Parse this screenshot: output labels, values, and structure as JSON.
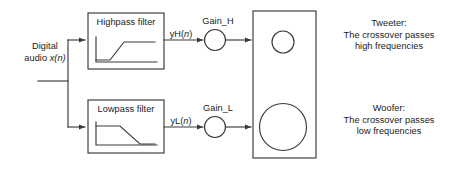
{
  "diagram": {
    "input": {
      "line1": "Digital",
      "line2_prefix": "audio ",
      "line2_var": "x(n)"
    },
    "branches": [
      {
        "id": "high",
        "filter_label": "Highpass filter",
        "signal_prefix": "yH(",
        "signal_var": "n",
        "signal_suffix": ")",
        "gain_label": "Gain_H",
        "response_type": "highpass",
        "driver_name": "Tweeter:",
        "driver_desc_line1": "The crossover passes",
        "driver_desc_line2": "high frequencies"
      },
      {
        "id": "low",
        "filter_label": "Lowpass filter",
        "signal_prefix": "yL(",
        "signal_var": "n",
        "signal_suffix": ")",
        "gain_label": "Gain_L",
        "response_type": "lowpass",
        "driver_name": "Woofer:",
        "driver_desc_line1": "The crossover passes",
        "driver_desc_line2": "low frequencies"
      }
    ],
    "speaker_cabinet": {
      "tweeter_driver": "small-circle",
      "woofer_driver": "large-circle"
    },
    "colors": {
      "stroke": "#3a3a3a",
      "text": "#1a1a1a",
      "background": "#ffffff"
    }
  }
}
